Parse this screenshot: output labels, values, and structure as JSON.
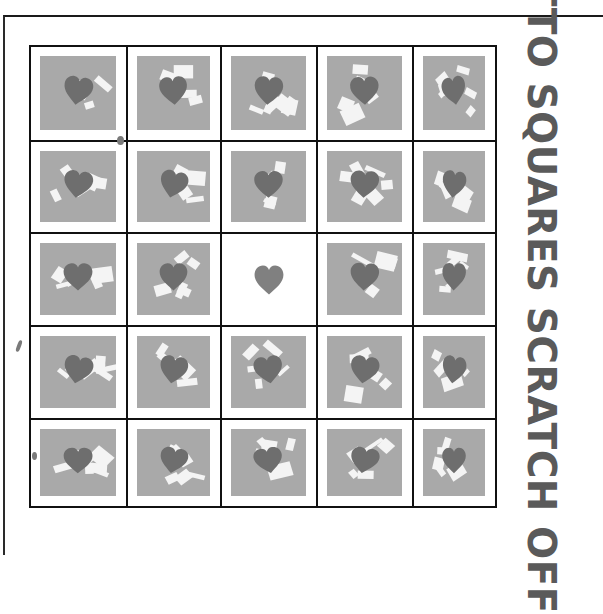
{
  "ticket": {
    "title": "LOTTO SQUARES SCRATCH OFF",
    "rows": 5,
    "cols": 5,
    "colors": {
      "tile_grey": "#a9a9a9",
      "heart_dark": "#6e6e6e",
      "heart_free": "#808080",
      "scratch_white": "#f4f4f4",
      "grid_line": "#111111",
      "title_text": "#5a5a5a"
    },
    "free_cell": {
      "row": 2,
      "col": 2,
      "symbol": "heart-icon",
      "state": "unscratched-free"
    },
    "cells": [
      [
        {
          "symbol": "heart",
          "state": "scratched"
        },
        {
          "symbol": "heart",
          "state": "scratched"
        },
        {
          "symbol": "heart",
          "state": "scratched"
        },
        {
          "symbol": "heart",
          "state": "scratched"
        },
        {
          "symbol": "heart",
          "state": "scratched"
        }
      ],
      [
        {
          "symbol": "heart",
          "state": "scratched"
        },
        {
          "symbol": "heart",
          "state": "scratched"
        },
        {
          "symbol": "heart",
          "state": "scratched"
        },
        {
          "symbol": "heart",
          "state": "scratched"
        },
        {
          "symbol": "heart",
          "state": "scratched"
        }
      ],
      [
        {
          "symbol": "heart",
          "state": "scratched"
        },
        {
          "symbol": "heart",
          "state": "scratched"
        },
        {
          "symbol": "heart",
          "state": "free"
        },
        {
          "symbol": "heart",
          "state": "scratched"
        },
        {
          "symbol": "heart",
          "state": "scratched"
        }
      ],
      [
        {
          "symbol": "heart",
          "state": "scratched"
        },
        {
          "symbol": "heart",
          "state": "scratched"
        },
        {
          "symbol": "heart",
          "state": "scratched"
        },
        {
          "symbol": "heart",
          "state": "scratched"
        },
        {
          "symbol": "heart",
          "state": "scratched"
        }
      ],
      [
        {
          "symbol": "heart",
          "state": "scratched"
        },
        {
          "symbol": "heart",
          "state": "scratched"
        },
        {
          "symbol": "heart",
          "state": "scratched"
        },
        {
          "symbol": "heart",
          "state": "scratched"
        },
        {
          "symbol": "heart",
          "state": "scratched"
        }
      ]
    ]
  }
}
